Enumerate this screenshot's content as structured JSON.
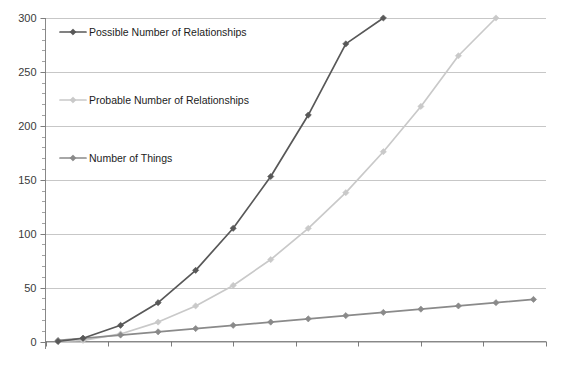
{
  "chart_data": {
    "type": "line",
    "title": "",
    "subtitle": "",
    "xlabel": "",
    "ylabel": "",
    "x": [
      1,
      3,
      6,
      9,
      12,
      15,
      18,
      21,
      24,
      27,
      30,
      33,
      36,
      39
    ],
    "ylim": [
      0,
      300
    ],
    "xlim": [
      0,
      40
    ],
    "y_ticks": [
      0,
      50,
      100,
      150,
      200,
      250,
      300
    ],
    "y_tick_labels": [
      "0",
      "50",
      "100",
      "150",
      "200",
      "250",
      "300"
    ],
    "y_minor_tick_step": 10,
    "x_ticks": [
      0,
      5,
      10,
      15,
      20,
      25,
      30,
      35,
      40
    ],
    "x_tick_labels": [
      "",
      "",
      "",
      "",
      "",
      "",
      "",
      "",
      ""
    ],
    "grid": "horizontal",
    "legend_position": "inside-upper-left",
    "series": [
      {
        "name": "Possible Number of Relationships",
        "color": "#585858",
        "marker": "diamond",
        "values": [
          0,
          3,
          15,
          36,
          66,
          105,
          153,
          210,
          276,
          300,
          null,
          null,
          null,
          null
        ],
        "clipped_at": 300
      },
      {
        "name": "Probable Number of Relationships",
        "color": "#c9c9c9",
        "marker": "diamond",
        "values": [
          0,
          1,
          7,
          18,
          33,
          52,
          76,
          105,
          138,
          176,
          218,
          265,
          300,
          null
        ],
        "clipped_at": 300
      },
      {
        "name": "Number of Things",
        "color": "#8a8a8a",
        "marker": "diamond",
        "values": [
          1,
          3,
          6,
          9,
          12,
          15,
          18,
          21,
          24,
          27,
          30,
          33,
          36,
          39
        ],
        "clipped_at": null
      }
    ]
  },
  "legend": {
    "entries": [
      {
        "label": "Possible Number of Relationships",
        "color": "#585858"
      },
      {
        "label": "Probable Number of Relationships",
        "color": "#c9c9c9"
      },
      {
        "label": "Number of Things",
        "color": "#8a8a8a"
      }
    ]
  },
  "axis": {
    "y_labels": [
      "300",
      "250",
      "200",
      "150",
      "100",
      "50",
      "0"
    ]
  },
  "colors": {
    "gridline": "#b9b9b9",
    "axis": "#7a7a7a",
    "background": "#ffffff",
    "text": "#3a3a3a"
  }
}
